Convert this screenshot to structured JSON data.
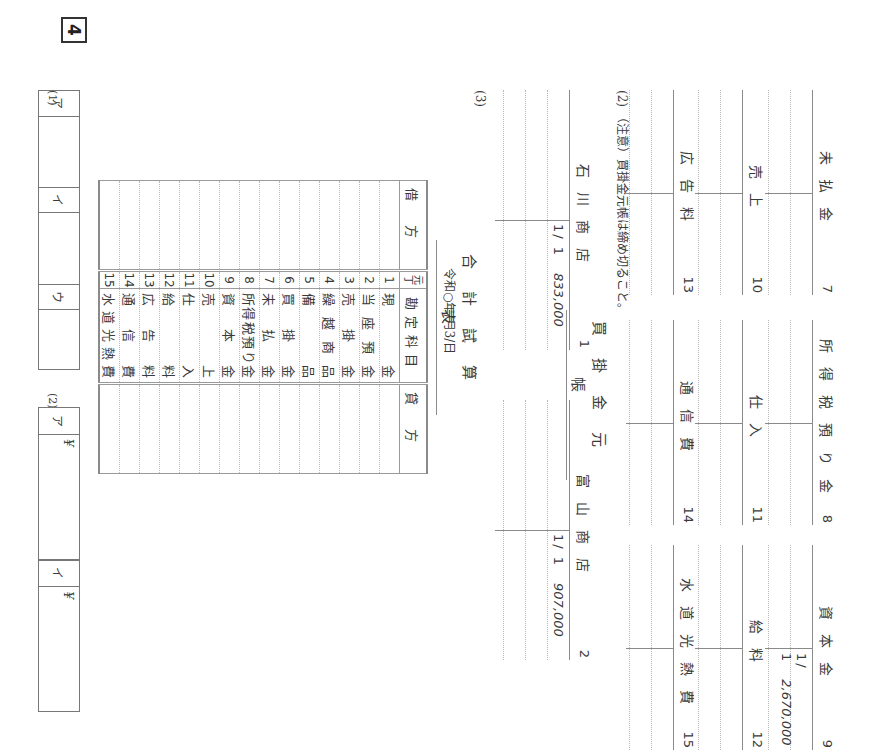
{
  "section1": {
    "t_accounts": [
      {
        "name": "未払金",
        "num": "7",
        "entries": []
      },
      {
        "name": "所得税預り金",
        "num": "8",
        "entries": []
      },
      {
        "name": "資本金",
        "num": "9",
        "entries": [
          {
            "side": "credit",
            "date": "1/ 1",
            "amount": "2,670,000"
          }
        ]
      },
      {
        "name": "売上",
        "num": "10",
        "entries": []
      },
      {
        "name": "仕入",
        "num": "11",
        "entries": []
      },
      {
        "name": "給料",
        "num": "12",
        "entries": []
      },
      {
        "name": "広告料",
        "num": "13",
        "entries": []
      },
      {
        "name": "通信費",
        "num": "14",
        "entries": []
      },
      {
        "name": "水道光熱費",
        "num": "15",
        "entries": []
      }
    ]
  },
  "section2": {
    "label": "(2)",
    "note": "（注意）買掛金元帳は締め切ること。",
    "ledger_title": "買掛金元帳",
    "accounts": [
      {
        "name": "石川商店",
        "num": "1",
        "entries": [
          {
            "side": "credit",
            "date": "1/ 1",
            "amount": "833,000"
          }
        ]
      },
      {
        "name": "富山商店",
        "num": "2",
        "entries": [
          {
            "side": "credit",
            "date": "1/ 1",
            "amount": "907,000"
          }
        ]
      }
    ]
  },
  "section3": {
    "label": "(3)",
    "title": "合計試算表",
    "date": "令和○年/月3/日",
    "headers": {
      "debit": "借方",
      "ref": "元丁",
      "account": "勘定科目",
      "credit": "貸方"
    },
    "rows": [
      {
        "no": "1",
        "account": "現金"
      },
      {
        "no": "2",
        "account": "当座預金"
      },
      {
        "no": "3",
        "account": "売掛金"
      },
      {
        "no": "4",
        "account": "繰越商品"
      },
      {
        "no": "5",
        "account": "備品"
      },
      {
        "no": "6",
        "account": "買掛金"
      },
      {
        "no": "7",
        "account": "未払金"
      },
      {
        "no": "8",
        "account": "所得税預り金"
      },
      {
        "no": "9",
        "account": "資本金"
      },
      {
        "no": "10",
        "account": "売上"
      },
      {
        "no": "11",
        "account": "仕入"
      },
      {
        "no": "12",
        "account": "給料"
      },
      {
        "no": "13",
        "account": "広告料"
      },
      {
        "no": "14",
        "account": "通信費"
      },
      {
        "no": "15",
        "account": "水道光熱費"
      }
    ]
  },
  "section4": {
    "number": "4",
    "part1": {
      "label": "(1)",
      "cells": [
        {
          "label": "ア",
          "value": ""
        },
        {
          "label": "イ",
          "value": ""
        },
        {
          "label": "ウ",
          "value": ""
        }
      ]
    },
    "part2": {
      "label": "(2)",
      "cells": [
        {
          "label": "ア",
          "value": "¥"
        },
        {
          "label": "イ",
          "value": "¥"
        }
      ]
    }
  }
}
